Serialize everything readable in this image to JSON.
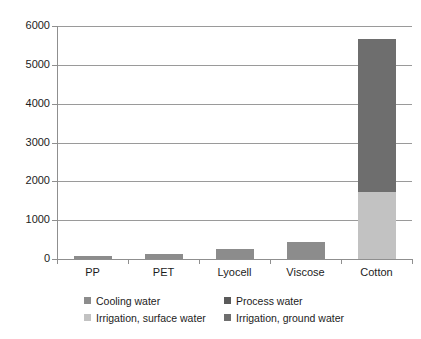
{
  "chart_data": {
    "type": "bar",
    "subtype": "stacked-bar",
    "title": "",
    "xlabel": "",
    "ylabel": "",
    "ylim": [
      0,
      6000
    ],
    "y_ticks": [
      0,
      1000,
      2000,
      3000,
      4000,
      5000,
      6000
    ],
    "y_tick_labels": [
      "0",
      "1000",
      "2000",
      "3000",
      "4000",
      "5000",
      "6000"
    ],
    "grid": true,
    "grid_axis": "y",
    "legend_position": "bottom",
    "categories": [
      "PP",
      "PET",
      "Lyocell",
      "Viscose",
      "Cotton"
    ],
    "series": [
      {
        "name": "Cooling water",
        "color": "#8c8c8c",
        "values": [
          80,
          130,
          270,
          450,
          0
        ]
      },
      {
        "name": "Process water",
        "color": "#5a5a5a",
        "values": [
          0,
          0,
          0,
          0,
          0
        ]
      },
      {
        "name": "Irrigation, surface water",
        "color": "#c2c2c2",
        "values": [
          0,
          0,
          0,
          0,
          1720
        ]
      },
      {
        "name": "Irrigation, ground water",
        "color": "#6e6e6e",
        "values": [
          0,
          0,
          0,
          0,
          3950
        ]
      }
    ],
    "totals": [
      80,
      130,
      270,
      450,
      5670
    ],
    "colors": {
      "cooling_water": "#8c8c8c",
      "process_water": "#5a5a5a",
      "irrigation_surface_water": "#c2c2c2",
      "irrigation_ground_water": "#6e6e6e",
      "gridline": "#9a9a9a",
      "axis": "#8f8f8f",
      "text": "#1c1c1c",
      "background": "#ffffff"
    }
  },
  "axis": {
    "y_tick_labels": [
      "6000",
      "5000",
      "4000",
      "3000",
      "2000",
      "1000",
      "0"
    ],
    "x_tick_labels": [
      "PP",
      "PET",
      "Lyocell",
      "Viscose",
      "Cotton"
    ]
  },
  "legend": {
    "entries": [
      {
        "label": "Cooling water",
        "color": "#8c8c8c"
      },
      {
        "label": "Process water",
        "color": "#5a5a5a"
      },
      {
        "label": "Irrigation, surface water",
        "color": "#c2c2c2"
      },
      {
        "label": "Irrigation, ground water",
        "color": "#6e6e6e"
      }
    ]
  }
}
